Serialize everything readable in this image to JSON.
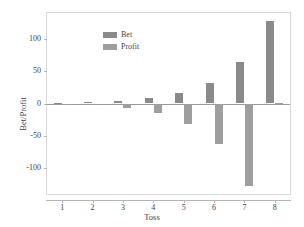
{
  "chart_data": {
    "type": "bar",
    "title": "",
    "xlabel": "Toss",
    "ylabel": "Bet/Profit",
    "categories": [
      "1",
      "2",
      "3",
      "4",
      "5",
      "6",
      "7",
      "8"
    ],
    "series": [
      {
        "name": "Bet",
        "color": "#8a8a8a",
        "values": [
          1,
          2,
          4,
          8,
          16,
          32,
          64,
          128
        ]
      },
      {
        "name": "Profit",
        "color": "#9e9e9e",
        "values": [
          -1,
          -3,
          -7,
          -15,
          -31,
          -63,
          -127,
          1
        ]
      }
    ],
    "ylim": [
      -140,
      140
    ],
    "yticks": [
      100,
      50,
      0,
      -50,
      -100
    ],
    "ytick_labels": [
      "100",
      "50",
      "0",
      "-50",
      "-100"
    ],
    "xticks": [
      1,
      2,
      3,
      4,
      5,
      6,
      7,
      8
    ],
    "xtick_labels": [
      "1",
      "2",
      "3",
      "4",
      "5",
      "6",
      "7",
      "8"
    ],
    "grid": false,
    "legend_position": "top-left",
    "legend_entries": [
      "Bet",
      "Profit"
    ]
  },
  "axes": {
    "x_title": "Toss",
    "y_title": "Bet/Profit"
  },
  "colors": {
    "bet": "#8a8a8a",
    "profit": "#9e9e9e",
    "frame": "#d8d8d8",
    "zero_line": "#9a9a9a",
    "background": "#ffffff"
  }
}
